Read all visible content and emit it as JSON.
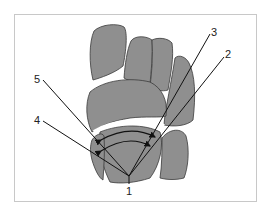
{
  "diagram": {
    "type": "anatomical-wrist-carpal-bones",
    "labels": [
      {
        "id": "1",
        "text": "1",
        "x": 129,
        "y": 191
      },
      {
        "id": "2",
        "text": "2",
        "x": 226,
        "y": 59
      },
      {
        "id": "3",
        "text": "3",
        "x": 212,
        "y": 36
      },
      {
        "id": "4",
        "text": "4",
        "x": 37,
        "y": 124
      },
      {
        "id": "5",
        "text": "5",
        "x": 37,
        "y": 82
      }
    ],
    "colors": {
      "bone_fill": "#8f8f8f",
      "bone_stroke": "#3a3a3a",
      "line": "#111111",
      "frame": "#c8c8c8",
      "background": "#ffffff"
    }
  }
}
